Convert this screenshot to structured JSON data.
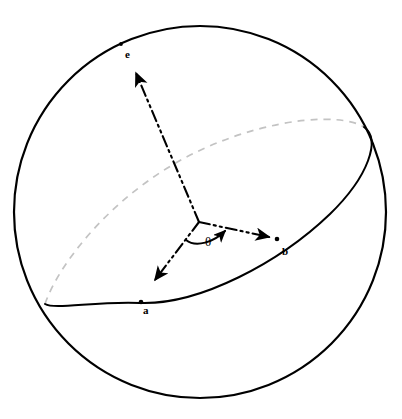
{
  "figure": {
    "background_color": "#ffffff",
    "width": 402,
    "height": 419
  },
  "sphere": {
    "name": "sphere-outline",
    "center": [
      200,
      212
    ],
    "radius": 186,
    "stroke_color": "#000000",
    "stroke_width": 2.2
  },
  "equator": {
    "name": "equatorial-circle",
    "front_arc_color": "#000000",
    "back_arc_color": "#c3c3c3",
    "back_arc_dash": "7 6",
    "front_stroke_width": 2.0,
    "back_stroke_width": 1.6
  },
  "axes": [
    {
      "id": "e",
      "label": "e",
      "label_pos": [
        126,
        50
      ],
      "origin": [
        199,
        222
      ],
      "tip": [
        133,
        69
      ],
      "style": "dash-dot-dot",
      "color": "#000000",
      "marker_on_sphere": [
        121,
        44
      ]
    },
    {
      "id": "b",
      "label": "b",
      "label_pos": [
        282,
        247
      ],
      "origin": [
        199,
        222
      ],
      "tip": [
        272,
        238
      ],
      "style": "dash-dot-dot",
      "color": "#000000",
      "marker_on_sphere": [
        276,
        238
      ]
    },
    {
      "id": "a",
      "label": "a",
      "label_pos": [
        143,
        306
      ],
      "origin": [
        199,
        222
      ],
      "tip": [
        152,
        283
      ],
      "style": "dash-dot-dot",
      "color": "#000000",
      "marker_on_sphere": [
        141,
        302
      ]
    }
  ],
  "angle": {
    "name": "theta",
    "symbol": "θ",
    "label_pos": [
      206,
      234
    ],
    "arc_color": "#000000",
    "arrow_direction": "counterclockwise-toward-b",
    "between": [
      "a",
      "b"
    ]
  },
  "colors": {
    "ink": "#000000",
    "hidden_line_gray": "#c3c3c3",
    "page": "#ffffff"
  }
}
